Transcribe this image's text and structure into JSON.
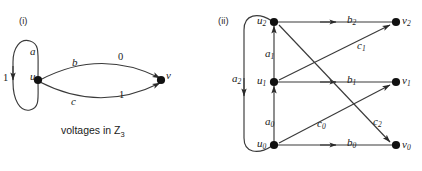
{
  "figure": {
    "panels": [
      {
        "id": "panel-i",
        "tag": "(i)",
        "caption": "voltages in Z",
        "caption_sub": "3",
        "nodes": [
          {
            "name": "u",
            "label": "u"
          },
          {
            "name": "v",
            "label": "v"
          }
        ],
        "edges": [
          {
            "name": "a",
            "label": "a",
            "voltage": "1",
            "from": "u",
            "to": "u",
            "kind": "loop"
          },
          {
            "name": "b",
            "label": "b",
            "voltage": "0",
            "from": "u",
            "to": "v",
            "kind": "arc-upper"
          },
          {
            "name": "c",
            "label": "c",
            "voltage": "1",
            "from": "u",
            "to": "v",
            "kind": "arc-lower"
          }
        ]
      },
      {
        "id": "panel-ii",
        "tag": "(ii)",
        "nodes": [
          {
            "name": "u2",
            "label": "u",
            "sub": "2"
          },
          {
            "name": "u1",
            "label": "u",
            "sub": "1"
          },
          {
            "name": "u0",
            "label": "u",
            "sub": "0"
          },
          {
            "name": "v2",
            "label": "v",
            "sub": "2"
          },
          {
            "name": "v1",
            "label": "v",
            "sub": "1"
          },
          {
            "name": "v0",
            "label": "v",
            "sub": "0"
          }
        ],
        "edges": [
          {
            "name": "a2",
            "label": "a",
            "sub": "2",
            "from": "u2",
            "to": "u0"
          },
          {
            "name": "a1",
            "label": "a",
            "sub": "1",
            "from": "u1",
            "to": "u2"
          },
          {
            "name": "a0",
            "label": "a",
            "sub": "0",
            "from": "u0",
            "to": "u1"
          },
          {
            "name": "b2",
            "label": "b",
            "sub": "2",
            "from": "u2",
            "to": "v2"
          },
          {
            "name": "b1",
            "label": "b",
            "sub": "1",
            "from": "u1",
            "to": "v1"
          },
          {
            "name": "b0",
            "label": "b",
            "sub": "0",
            "from": "u0",
            "to": "v0"
          },
          {
            "name": "c2",
            "label": "c",
            "sub": "2",
            "from": "u2",
            "to": "v0"
          },
          {
            "name": "c1",
            "label": "c",
            "sub": "1",
            "from": "u1",
            "to": "v2"
          },
          {
            "name": "c0",
            "label": "c",
            "sub": "0",
            "from": "u0",
            "to": "v1"
          }
        ]
      }
    ],
    "colors": {
      "stroke": "#3a3a3a",
      "node": "#111111",
      "text": "#1a1a1a",
      "background": "#ffffff"
    }
  }
}
